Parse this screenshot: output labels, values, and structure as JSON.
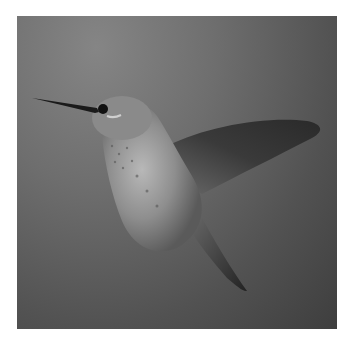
{
  "image": {
    "subject": "hummingbird in flight",
    "style": "grayscale photograph",
    "background_colors": {
      "light": "#858585",
      "mid": "#5e5e5e",
      "dark": "#3e3e3e"
    },
    "border_color": "#ffffff"
  }
}
